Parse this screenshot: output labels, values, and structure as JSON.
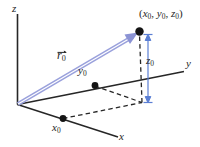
{
  "figure": {
    "colors": {
      "axis": "#262626",
      "vector": "#8b93d4",
      "dashed": "#262626",
      "text": "#262626",
      "background": "#ffffff"
    },
    "axes": [
      {
        "id": "z",
        "label": "z"
      },
      {
        "id": "y",
        "label": "y"
      },
      {
        "id": "x",
        "label": "x"
      }
    ],
    "vector": {
      "name": "r",
      "subscript": "0",
      "accent": "arrow"
    },
    "point": {
      "open_paren": "(",
      "x": "x",
      "x_sub": "0",
      "comma1": ",",
      "y": "y",
      "y_sub": "0",
      "comma2": ",",
      "z": "z",
      "z_sub": "0",
      "close_paren": ")"
    },
    "components": [
      {
        "id": "x0",
        "base": "x",
        "sub": "0"
      },
      {
        "id": "y0",
        "base": "y",
        "sub": "0"
      },
      {
        "id": "z0",
        "base": "z",
        "sub": "0"
      }
    ]
  }
}
